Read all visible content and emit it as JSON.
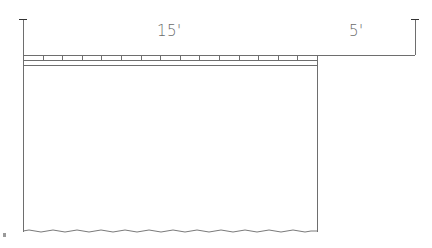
{
  "diagram": {
    "type": "architectural-elevation-sketch",
    "line_color": "#6e6e6e",
    "dimensions": [
      {
        "id": "span-main",
        "label": "15'",
        "value_ft": 15
      },
      {
        "id": "span-extension",
        "label": "5'",
        "value_ft": 5
      }
    ],
    "tick_count": 15
  }
}
